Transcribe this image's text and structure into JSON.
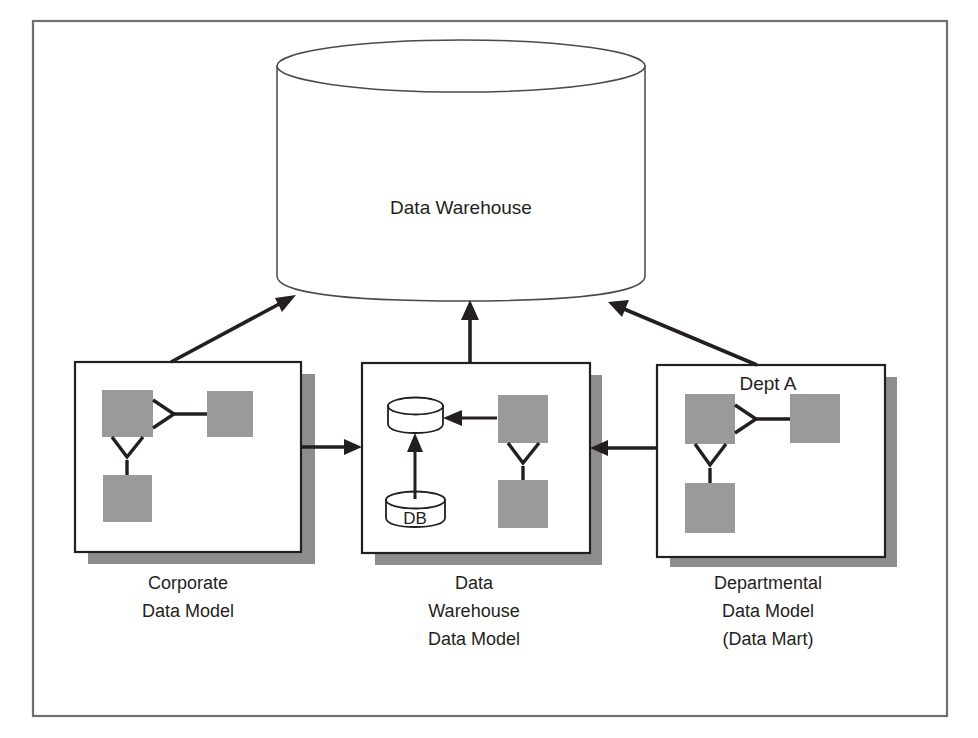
{
  "figure": {
    "background_color": "#ffffff",
    "frame_color": "#6f6f6f",
    "entity_fill_color": "#9a9a9a",
    "shadow_color": "#8d8d8d",
    "line_color": "#231f20"
  },
  "warehouse": {
    "label": "Data Warehouse",
    "shape": "cylinder-icon"
  },
  "panels": [
    {
      "id": "corporate",
      "inner_title": "",
      "caption_lines": [
        "Corporate",
        "Data Model"
      ],
      "entities": [
        {
          "name": "entity-top-left"
        },
        {
          "name": "entity-top-right"
        },
        {
          "name": "entity-bottom-left"
        }
      ],
      "databases": []
    },
    {
      "id": "warehouse-model",
      "inner_title": "",
      "caption_lines": [
        "Data",
        "Warehouse",
        "Data Model"
      ],
      "entities": [
        {
          "name": "entity-top-right"
        },
        {
          "name": "entity-bottom-right"
        }
      ],
      "databases": [
        {
          "name": "target-database",
          "label": ""
        },
        {
          "name": "source-database",
          "label": "DB"
        }
      ]
    },
    {
      "id": "departmental",
      "inner_title": "Dept A",
      "caption_lines": [
        "Departmental",
        "Data Model",
        "(Data Mart)"
      ],
      "entities": [
        {
          "name": "entity-top-left"
        },
        {
          "name": "entity-top-right"
        },
        {
          "name": "entity-bottom-left"
        }
      ],
      "databases": []
    }
  ],
  "flows": [
    {
      "name": "corporate-to-warehouse",
      "from": "corporate",
      "to": "warehouse",
      "direction": "up-right"
    },
    {
      "name": "warehouse-model-to-warehouse",
      "from": "warehouse-model",
      "to": "warehouse",
      "direction": "up"
    },
    {
      "name": "departmental-to-warehouse",
      "from": "departmental",
      "to": "warehouse",
      "direction": "up-left"
    },
    {
      "name": "corporate-to-warehouse-model",
      "from": "corporate",
      "to": "warehouse-model",
      "direction": "right"
    },
    {
      "name": "departmental-to-warehouse-model",
      "from": "departmental",
      "to": "warehouse-model",
      "direction": "left"
    }
  ]
}
